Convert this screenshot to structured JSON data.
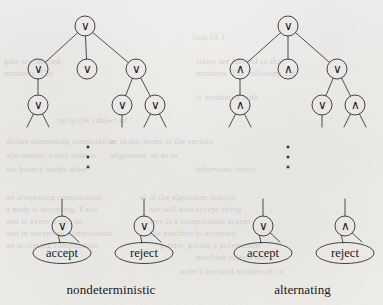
{
  "figure": {
    "background_color": "#efeeec",
    "ink_color": "#3a3a3a",
    "text_color": "#1a1a1a",
    "width": 383,
    "height": 305,
    "node_radius": 10,
    "ellipsis_glyph": "⋮",
    "symbols": {
      "or": "∨",
      "and": "∧"
    },
    "panels": [
      {
        "id": "nondeterministic",
        "caption": "nondeterministic",
        "caption_x": 111,
        "caption_y": 282,
        "ellipsis": {
          "x": 88,
          "y": 157
        },
        "nodes": [
          {
            "id": "nd-root",
            "label": "∨",
            "x": 85,
            "y": 26,
            "level": 0
          },
          {
            "id": "nd-l1a",
            "label": "∨",
            "x": 38,
            "y": 69,
            "level": 1
          },
          {
            "id": "nd-l1b",
            "label": "∨",
            "x": 87,
            "y": 69,
            "level": 1
          },
          {
            "id": "nd-l1c",
            "label": "∨",
            "x": 136,
            "y": 69,
            "level": 1
          },
          {
            "id": "nd-l2a",
            "label": "∨",
            "x": 38,
            "y": 105,
            "level": 2
          },
          {
            "id": "nd-l2b",
            "label": "∨",
            "x": 122,
            "y": 105,
            "level": 2
          },
          {
            "id": "nd-l2c",
            "label": "∨",
            "x": 155,
            "y": 105,
            "level": 2
          },
          {
            "id": "nd-accept-node",
            "label": "∨",
            "x": 62,
            "y": 226,
            "level": "leaf"
          },
          {
            "id": "nd-reject-node",
            "label": "∨",
            "x": 144,
            "y": 226,
            "level": "leaf"
          }
        ],
        "edges": [
          {
            "from": "nd-root",
            "to": "nd-l1a"
          },
          {
            "from": "nd-root",
            "to": "nd-l1b"
          },
          {
            "from": "nd-root",
            "to": "nd-l1c"
          },
          {
            "from": "nd-l1a",
            "to": "nd-l2a"
          },
          {
            "from": "nd-l1c",
            "to": "nd-l2b"
          },
          {
            "from": "nd-l1c",
            "to": "nd-l2c"
          }
        ],
        "stubs": [
          {
            "from": "nd-l2a",
            "dx": -11,
            "dy": 22
          },
          {
            "from": "nd-l2a",
            "dx": 11,
            "dy": 22
          },
          {
            "from": "nd-l2b",
            "dx": 0,
            "dy": 22
          },
          {
            "from": "nd-l2c",
            "dx": -11,
            "dy": 22
          },
          {
            "from": "nd-l2c",
            "dx": 11,
            "dy": 22
          }
        ],
        "leaves": [
          {
            "id": "nd-accept",
            "label": "accept",
            "x": 62,
            "y": 253,
            "parent": "nd-accept-node"
          },
          {
            "id": "nd-reject",
            "label": "reject",
            "x": 144,
            "y": 253,
            "parent": "nd-reject-node"
          }
        ]
      },
      {
        "id": "alternating",
        "caption": "alternating",
        "caption_x": 300,
        "caption_y": 282,
        "ellipsis": {
          "x": 288,
          "y": 157
        },
        "nodes": [
          {
            "id": "al-root",
            "label": "∨",
            "x": 288,
            "y": 26,
            "level": 0
          },
          {
            "id": "al-l1a",
            "label": "∧",
            "x": 240,
            "y": 69,
            "level": 1
          },
          {
            "id": "al-l1b",
            "label": "∧",
            "x": 288,
            "y": 69,
            "level": 1
          },
          {
            "id": "al-l1c",
            "label": "∨",
            "x": 337,
            "y": 69,
            "level": 1
          },
          {
            "id": "al-l2a",
            "label": "∧",
            "x": 240,
            "y": 105,
            "level": 2
          },
          {
            "id": "al-l2b",
            "label": "∨",
            "x": 322,
            "y": 105,
            "level": 2
          },
          {
            "id": "al-l2c",
            "label": "∧",
            "x": 355,
            "y": 105,
            "level": 2
          },
          {
            "id": "al-accept-node",
            "label": "∨",
            "x": 263,
            "y": 226,
            "level": "leaf"
          },
          {
            "id": "al-reject-node",
            "label": "∧",
            "x": 345,
            "y": 226,
            "level": "leaf"
          }
        ],
        "edges": [
          {
            "from": "al-root",
            "to": "al-l1a"
          },
          {
            "from": "al-root",
            "to": "al-l1b"
          },
          {
            "from": "al-root",
            "to": "al-l1c"
          },
          {
            "from": "al-l1a",
            "to": "al-l2a"
          },
          {
            "from": "al-l1c",
            "to": "al-l2b"
          },
          {
            "from": "al-l1c",
            "to": "al-l2c"
          }
        ],
        "stubs": [
          {
            "from": "al-l2a",
            "dx": -11,
            "dy": 22
          },
          {
            "from": "al-l2a",
            "dx": 11,
            "dy": 22
          },
          {
            "from": "al-l2b",
            "dx": 0,
            "dy": 22
          },
          {
            "from": "al-l2c",
            "dx": -11,
            "dy": 22
          },
          {
            "from": "al-l2c",
            "dx": 11,
            "dy": 22
          }
        ],
        "leaves": [
          {
            "id": "al-accept",
            "label": "accept",
            "x": 263,
            "y": 253,
            "parent": "al-accept-node"
          },
          {
            "id": "al-reject",
            "label": "reject",
            "x": 345,
            "y": 253,
            "parent": "al-reject-node"
          }
        ]
      }
    ]
  }
}
